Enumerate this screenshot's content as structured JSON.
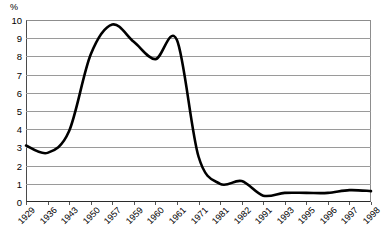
{
  "chart_data": {
    "type": "line",
    "title": "",
    "subtitle": "",
    "xlabel": "",
    "ylabel": "%",
    "unit_label": "%",
    "ylim": [
      0,
      10
    ],
    "y_ticks": [
      10,
      9,
      8,
      7,
      6,
      5,
      4,
      3,
      2,
      1,
      0
    ],
    "grid": true,
    "grid_axis": "y",
    "legend": "none",
    "legend_position": "none",
    "categories": [
      "1929",
      "1936",
      "1943",
      "1950",
      "1957",
      "1959",
      "1960",
      "1961",
      "1971",
      "1981",
      "1982",
      "1991",
      "1993",
      "1995",
      "1996",
      "1997",
      "1998"
    ],
    "x_tick_labels": [
      "1929",
      "1936",
      "1943",
      "1950",
      "1957",
      "1959",
      "1960",
      "1961",
      "1971",
      "1981",
      "1982",
      "1991",
      "1993",
      "1995",
      "1996",
      "1997",
      "1998"
    ],
    "values": [
      3.1,
      2.7,
      3.9,
      8.1,
      9.75,
      8.8,
      7.85,
      8.9,
      2.5,
      1.0,
      1.15,
      0.35,
      0.5,
      0.5,
      0.5,
      0.65,
      0.6
    ],
    "series": [
      {
        "name": "series-1",
        "color": "#000000",
        "values": [
          3.1,
          2.7,
          3.9,
          8.1,
          9.75,
          8.8,
          7.85,
          8.9,
          2.5,
          1.0,
          1.15,
          0.35,
          0.5,
          0.5,
          0.5,
          0.65,
          0.6
        ]
      }
    ],
    "annotations": [],
    "notes": {
      "start_value": 3.1,
      "minimum_early": 2.65,
      "peak_value": 9.75,
      "peak_category": "1957",
      "secondary_peak": 8.9,
      "secondary_peak_category": "1961",
      "trough_late": 0.35,
      "trough_late_category": "1991",
      "end_value": 0.6
    }
  },
  "colors": {
    "curve": "#000000",
    "gridline": "#9a9a9a",
    "axis": "#2b2b2b",
    "background": "#ffffff",
    "text": "#000000"
  }
}
